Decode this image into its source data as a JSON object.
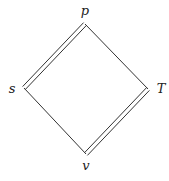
{
  "diagram": {
    "type": "diamond-lattice",
    "nodes": {
      "top": {
        "label": "p",
        "x": 85,
        "y": 24
      },
      "left": {
        "label": "s",
        "x": 24,
        "y": 88
      },
      "right": {
        "label": "T",
        "x": 148,
        "y": 89
      },
      "bottom": {
        "label": "v",
        "x": 86,
        "y": 154
      }
    },
    "edges": [
      {
        "from": "s",
        "to": "p",
        "style": "double"
      },
      {
        "from": "p",
        "to": "T",
        "style": "single"
      },
      {
        "from": "T",
        "to": "v",
        "style": "double"
      },
      {
        "from": "v",
        "to": "s",
        "style": "single"
      }
    ],
    "colors": {
      "line": "#333333",
      "background": "#ffffff"
    }
  }
}
